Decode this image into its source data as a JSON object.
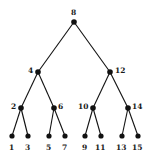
{
  "figure": {
    "name": "binary-search-tree-diagram",
    "background_color": "#ffffff",
    "node_color": "#111111",
    "edge_color": "#111111",
    "label_color": "#1a1a1a",
    "width": 151,
    "height": 155
  },
  "chart_data": {
    "type": "diagram",
    "diagram_kind": "binary-search-tree",
    "title": "",
    "levels": 4,
    "node_count": 15,
    "labels": [
      "8",
      "4",
      "12",
      "2",
      "6",
      "10",
      "14",
      "1",
      "3",
      "5",
      "7",
      "9",
      "11",
      "13",
      "15"
    ],
    "nodes": [
      {
        "id": "n8",
        "label": "8",
        "level": 0,
        "x": 74,
        "y": 22,
        "label_x": 71,
        "label_y": 9,
        "label_pos": "above"
      },
      {
        "id": "n4",
        "label": "4",
        "level": 1,
        "x": 38,
        "y": 72,
        "label_x": 28,
        "label_y": 67,
        "label_pos": "left"
      },
      {
        "id": "n12",
        "label": "12",
        "level": 1,
        "x": 110,
        "y": 72,
        "label_x": 115,
        "label_y": 67,
        "label_pos": "right"
      },
      {
        "id": "n2",
        "label": "2",
        "level": 2,
        "x": 21,
        "y": 108,
        "label_x": 11,
        "label_y": 103,
        "label_pos": "left"
      },
      {
        "id": "n6",
        "label": "6",
        "level": 2,
        "x": 54,
        "y": 108,
        "label_x": 58,
        "label_y": 103,
        "label_pos": "right"
      },
      {
        "id": "n10",
        "label": "10",
        "level": 2,
        "x": 93,
        "y": 108,
        "label_x": 78,
        "label_y": 103,
        "label_pos": "left"
      },
      {
        "id": "n14",
        "label": "14",
        "level": 2,
        "x": 128,
        "y": 108,
        "label_x": 132,
        "label_y": 103,
        "label_pos": "right"
      },
      {
        "id": "n1",
        "label": "1",
        "level": 3,
        "x": 12,
        "y": 136,
        "label_x": 9,
        "label_y": 144,
        "label_pos": "below"
      },
      {
        "id": "n3",
        "label": "3",
        "level": 3,
        "x": 28,
        "y": 136,
        "label_x": 25,
        "label_y": 144,
        "label_pos": "below"
      },
      {
        "id": "n5",
        "label": "5",
        "level": 3,
        "x": 49,
        "y": 136,
        "label_x": 46,
        "label_y": 144,
        "label_pos": "below"
      },
      {
        "id": "n7",
        "label": "7",
        "level": 3,
        "x": 65,
        "y": 136,
        "label_x": 62,
        "label_y": 144,
        "label_pos": "below"
      },
      {
        "id": "n9",
        "label": "9",
        "level": 3,
        "x": 85,
        "y": 136,
        "label_x": 82,
        "label_y": 144,
        "label_pos": "below"
      },
      {
        "id": "n11",
        "label": "11",
        "level": 3,
        "x": 101,
        "y": 136,
        "label_x": 95,
        "label_y": 144,
        "label_pos": "below"
      },
      {
        "id": "n13",
        "label": "13",
        "level": 3,
        "x": 122,
        "y": 136,
        "label_x": 116,
        "label_y": 144,
        "label_pos": "below"
      },
      {
        "id": "n15",
        "label": "15",
        "level": 3,
        "x": 138,
        "y": 136,
        "label_x": 132,
        "label_y": 144,
        "label_pos": "below"
      }
    ],
    "edges": [
      {
        "from": "n8",
        "to": "n4"
      },
      {
        "from": "n8",
        "to": "n12"
      },
      {
        "from": "n4",
        "to": "n2"
      },
      {
        "from": "n4",
        "to": "n6"
      },
      {
        "from": "n12",
        "to": "n10"
      },
      {
        "from": "n12",
        "to": "n14"
      },
      {
        "from": "n2",
        "to": "n1"
      },
      {
        "from": "n2",
        "to": "n3"
      },
      {
        "from": "n6",
        "to": "n5"
      },
      {
        "from": "n6",
        "to": "n7"
      },
      {
        "from": "n10",
        "to": "n9"
      },
      {
        "from": "n10",
        "to": "n11"
      },
      {
        "from": "n14",
        "to": "n13"
      },
      {
        "from": "n14",
        "to": "n15"
      }
    ]
  }
}
